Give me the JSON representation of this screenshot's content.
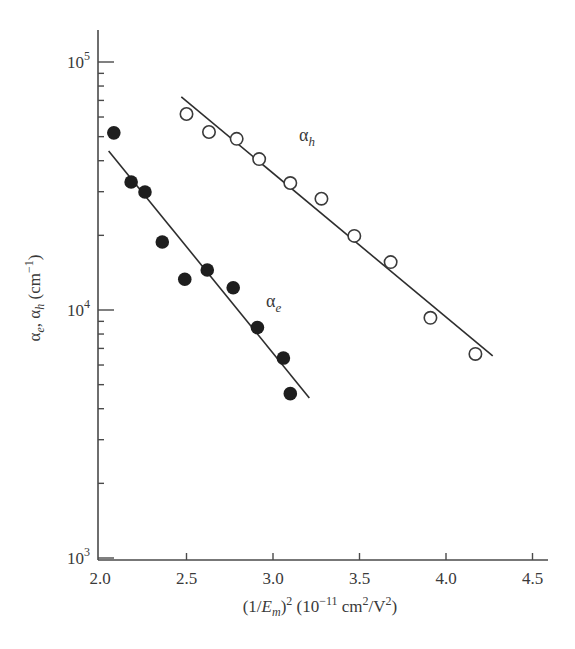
{
  "chart_data": {
    "type": "scatter",
    "title": "",
    "xlabel": "(1/E_m)^2 (10^-11 cm^2/V^2)",
    "ylabel": "α_e, α_h (cm^-1)",
    "xlim": [
      2.0,
      4.6
    ],
    "ylim": [
      1000,
      150000
    ],
    "yscale": "log",
    "grid": false,
    "legend": "none (series labeled inline)",
    "x_ticks": [
      2.0,
      2.5,
      3.0,
      3.5,
      4.0,
      4.5
    ],
    "x_tick_labels": [
      "2.0",
      "2.5",
      "3.0",
      "3.5",
      "4.0",
      "4.5"
    ],
    "y_ticks": [
      1000,
      10000,
      100000
    ],
    "y_tick_labels": [
      {
        "base": "10",
        "exp": "3"
      },
      {
        "base": "10",
        "exp": "4"
      },
      {
        "base": "10",
        "exp": "5"
      }
    ],
    "series": [
      {
        "name": "α_h",
        "label_base": "α",
        "label_sub": "h",
        "marker": "open-circle",
        "label_pos": [
          3.15,
          48000
        ],
        "x": [
          2.5,
          2.63,
          2.79,
          2.92,
          3.1,
          3.28,
          3.47,
          3.68,
          3.91,
          4.17
        ],
        "y": [
          61700,
          52200,
          49000,
          40600,
          32500,
          28100,
          19900,
          15600,
          9300,
          6650
        ],
        "fit_line": {
          "x": [
            2.47,
            4.27
          ],
          "y": [
            72300,
            6530
          ]
        }
      },
      {
        "name": "α_e",
        "label_base": "α",
        "label_sub": "e",
        "marker": "filled-circle",
        "label_pos": [
          2.96,
          10300
        ],
        "x": [
          2.08,
          2.18,
          2.26,
          2.36,
          2.49,
          2.62,
          2.77,
          2.91,
          3.06,
          3.1
        ],
        "y": [
          51800,
          32800,
          29900,
          18800,
          13300,
          14500,
          12300,
          8500,
          6400,
          4600
        ],
        "fit_line": {
          "x": [
            2.05,
            3.21
          ],
          "y": [
            43800,
            4420
          ]
        }
      }
    ]
  },
  "axes": {
    "x_title_parts": {
      "p1": "(1/",
      "E": "E",
      "m": "m",
      "p2": ")",
      "sq": "2",
      "p3": " (10",
      "exp": "−11",
      "p4": " cm",
      "sq2": "2",
      "p5": "/V",
      "sq3": "2",
      "p6": ")"
    },
    "y_title_parts": {
      "a1": "α",
      "e": "e",
      "comma": ", ",
      "a2": "α",
      "h": "h",
      "unit": " (cm",
      "exp": "−1",
      "close": ")"
    }
  }
}
